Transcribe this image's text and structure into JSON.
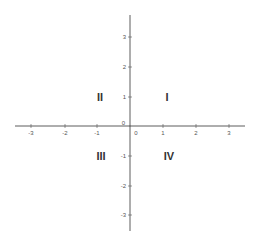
{
  "diagram": {
    "type": "cartesian-plane",
    "x_ticks": [
      "-3",
      "-2",
      "-1",
      "0",
      "1",
      "2",
      "3"
    ],
    "y_ticks": [
      "3",
      "2",
      "1",
      "0",
      "-1",
      "-2",
      "-3"
    ],
    "origin_labels": [
      "0",
      "0"
    ],
    "quadrants": [
      {
        "label": "I",
        "position": "top-right"
      },
      {
        "label": "II",
        "position": "top-left"
      },
      {
        "label": "III",
        "position": "bottom-left"
      },
      {
        "label": "IV",
        "position": "bottom-right"
      }
    ]
  }
}
